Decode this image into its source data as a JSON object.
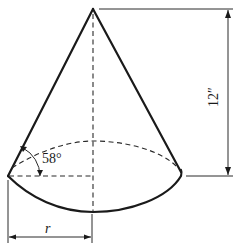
{
  "figure": {
    "type": "cone-diagram",
    "labels": {
      "height": "12″",
      "radius": "r",
      "angle": "58°"
    },
    "values": {
      "height_inches": 12,
      "base_angle_degrees": 58
    },
    "colors": {
      "line": "#1a1a1a",
      "background": "#ffffff"
    }
  }
}
